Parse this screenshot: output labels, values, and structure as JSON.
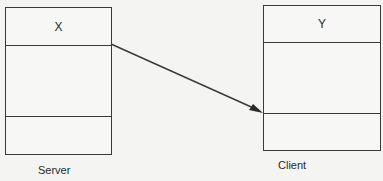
{
  "diagram": {
    "nodes": [
      {
        "id": "server-box",
        "title": "X",
        "caption": "Server",
        "compartments": 3
      },
      {
        "id": "client-box",
        "title": "Y",
        "caption": "Client",
        "compartments": 3
      }
    ],
    "edges": [
      {
        "from": "X (bottom of title compartment, right edge)",
        "to": "Y (bottom of middle compartment, left edge)",
        "style": "solid arrow"
      }
    ],
    "colors": {
      "line": "#3a3a3a",
      "background": "#f4f4f2"
    }
  }
}
